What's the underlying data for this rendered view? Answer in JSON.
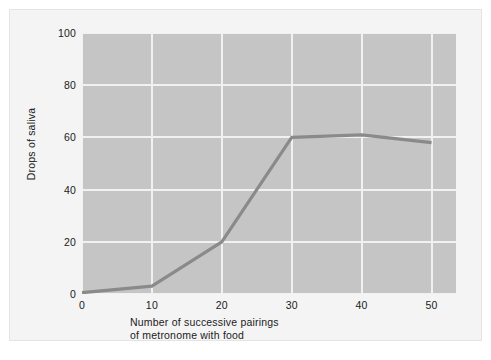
{
  "chart_data": {
    "type": "line",
    "title": "",
    "subtitle": "",
    "xlabel_line1": "Number of successive pairings",
    "xlabel_line2": "of metronome with food",
    "ylabel": "Drops of saliva",
    "xlim": [
      0,
      53.5
    ],
    "ylim": [
      0,
      100
    ],
    "xticks": [
      0,
      10,
      20,
      30,
      40,
      50
    ],
    "yticks": [
      0,
      20,
      40,
      60,
      80,
      100
    ],
    "xtick_labels": [
      "0",
      "10",
      "20",
      "30",
      "40",
      "50"
    ],
    "ytick_labels": [
      "0",
      "20",
      "40",
      "60",
      "80",
      "100"
    ],
    "grid": true,
    "legend": "none",
    "x": [
      0,
      10,
      20,
      30,
      40,
      50
    ],
    "series": [
      {
        "name": "Drops of saliva",
        "values": [
          0.5,
          3,
          20,
          60,
          61,
          58
        ],
        "color": "#8a8a8a"
      }
    ]
  },
  "style": {
    "plot_background": "#c5c5c5",
    "figure_background": "#f4f4f4",
    "gridline_color": "#f1f1f1",
    "line_color": "#8a8a8a",
    "text_color": "#1b1b1b"
  }
}
